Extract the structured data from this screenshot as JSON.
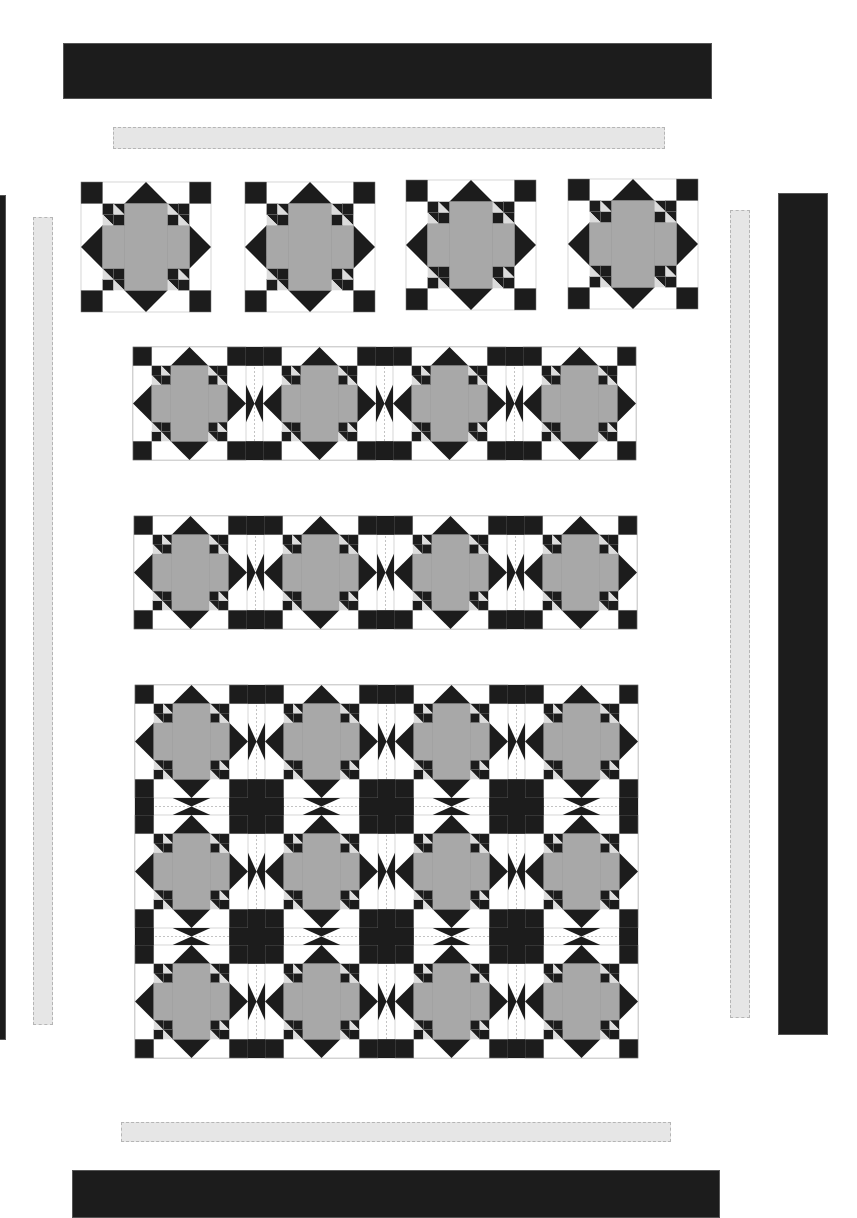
{
  "diagram": {
    "title": "",
    "colors": {
      "dark": "#1c1c1c",
      "gray": "#a8a8a8",
      "light": "#dcdcdc",
      "white": "#ffffff",
      "seam": "#9a9a9a"
    },
    "borders": [
      {
        "name": "top-outer-border",
        "type": "dark",
        "x": 63,
        "y": 43,
        "w": 649,
        "h": 56
      },
      {
        "name": "top-inner-border",
        "type": "light",
        "x": 113,
        "y": 127,
        "w": 552,
        "h": 22
      },
      {
        "name": "left-outer-border",
        "type": "dark",
        "x": -6,
        "y": 195,
        "w": 12,
        "h": 845
      },
      {
        "name": "left-inner-border",
        "type": "light",
        "x": 33,
        "y": 217,
        "w": 20,
        "h": 808
      },
      {
        "name": "right-inner-border",
        "type": "light",
        "x": 730,
        "y": 210,
        "w": 20,
        "h": 808
      },
      {
        "name": "right-outer-border",
        "type": "dark",
        "x": 778,
        "y": 193,
        "w": 50,
        "h": 842
      },
      {
        "name": "bottom-inner-border",
        "type": "light",
        "x": 121,
        "y": 1122,
        "w": 550,
        "h": 20
      },
      {
        "name": "bottom-outer-border",
        "type": "dark",
        "x": 72,
        "y": 1170,
        "w": 648,
        "h": 48
      }
    ],
    "single_blocks": [
      {
        "x": 81,
        "y": 182,
        "size": 130
      },
      {
        "x": 245,
        "y": 182,
        "size": 130
      },
      {
        "x": 406,
        "y": 180,
        "size": 130
      },
      {
        "x": 568,
        "y": 179,
        "size": 130
      }
    ],
    "rows": [
      {
        "name": "block-row-1",
        "x": 133,
        "y": 347,
        "blocks": 4,
        "block_size": 113,
        "sash": 17,
        "rows": 1
      },
      {
        "name": "block-row-2",
        "x": 134,
        "y": 516,
        "blocks": 4,
        "block_size": 113,
        "sash": 17,
        "rows": 1
      },
      {
        "name": "block-grid",
        "x": 135,
        "y": 685,
        "blocks": 4,
        "block_size": 113,
        "sash": 17,
        "rows": 3
      }
    ]
  }
}
